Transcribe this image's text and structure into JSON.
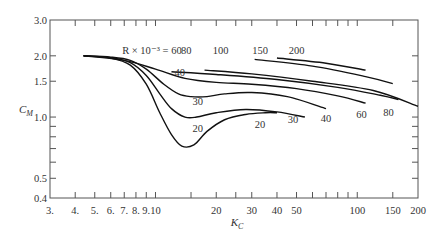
{
  "chart_data": {
    "type": "line",
    "title": "",
    "xlabel": "K_C",
    "ylabel": "C_M",
    "xscale": "log",
    "yscale": "log",
    "xlim": [
      3,
      200
    ],
    "ylim": [
      0.4,
      3.0
    ],
    "grid": false,
    "legend": "none (curves labeled inline with arrows)",
    "x_ticks": [
      3,
      4,
      5,
      6,
      7,
      8,
      9,
      10,
      20,
      30,
      40,
      50,
      100,
      150,
      200
    ],
    "x_tick_labels": [
      "3.",
      "4.",
      "5.",
      "6.",
      "7.",
      "8.",
      "9.",
      "10",
      "20",
      "30",
      "40",
      "50",
      "100",
      "150",
      "200"
    ],
    "x_minor_ticks": [
      15,
      25,
      60,
      70,
      80,
      90
    ],
    "y_ticks": [
      0.4,
      0.5,
      1.0,
      1.5,
      2.0,
      3.0
    ],
    "y_tick_labels": [
      "0.4",
      "0.5",
      "1.0",
      "1.5",
      "2.0",
      "3.0"
    ],
    "y_minor_ticks": [
      0.6,
      0.7,
      0.8,
      0.9
    ],
    "annotation_prefix": "R × 10⁻³ =",
    "series": [
      {
        "name": "R×10⁻³ = 20",
        "x": [
          4.4,
          6,
          7.5,
          9,
          10.5,
          12,
          13.5,
          15.5,
          18,
          22,
          28,
          35,
          40
        ],
        "y": [
          2.0,
          1.95,
          1.8,
          1.45,
          1.05,
          0.82,
          0.72,
          0.73,
          0.85,
          0.97,
          1.03,
          1.05,
          1.05
        ]
      },
      {
        "name": "R×10⁻³ = 30",
        "x": [
          4.4,
          6,
          7.5,
          9,
          10.5,
          12,
          14,
          16,
          20,
          28,
          40,
          55
        ],
        "y": [
          2.0,
          1.96,
          1.85,
          1.6,
          1.3,
          1.1,
          1.0,
          1.0,
          1.05,
          1.09,
          1.06,
          1.0
        ]
      },
      {
        "name": "R×10⁻³ = 40",
        "x": [
          4.4,
          6,
          7.5,
          9,
          11,
          13,
          15,
          18,
          22,
          30,
          45,
          70
        ],
        "y": [
          2.0,
          1.97,
          1.9,
          1.72,
          1.45,
          1.3,
          1.26,
          1.26,
          1.3,
          1.32,
          1.26,
          1.1
        ]
      },
      {
        "name": "R×10⁻³ = 60",
        "x": [
          4.4,
          7,
          10,
          14,
          20,
          30,
          50,
          80,
          110
        ],
        "y": [
          2.0,
          1.9,
          1.72,
          1.55,
          1.48,
          1.45,
          1.38,
          1.27,
          1.17
        ]
      },
      {
        "name": "R×10⁻³ = 80",
        "x": [
          12,
          20,
          40,
          80,
          130,
          160
        ],
        "y": [
          1.67,
          1.62,
          1.53,
          1.4,
          1.28,
          1.22
        ]
      },
      {
        "name": "R×10⁻³ = 100",
        "x": [
          17.5,
          30,
          60,
          120,
          200
        ],
        "y": [
          1.7,
          1.63,
          1.5,
          1.35,
          1.13
        ]
      },
      {
        "name": "R×10⁻³ = 150",
        "x": [
          31,
          60,
          110,
          150
        ],
        "y": [
          1.92,
          1.78,
          1.58,
          1.46
        ]
      },
      {
        "name": "R×10⁻³ = 200",
        "x": [
          40,
          70,
          110
        ],
        "y": [
          1.95,
          1.84,
          1.7
        ]
      }
    ],
    "annotations": [
      {
        "text": "R × 10⁻³ = 60",
        "x": 9.6,
        "y": 2.05
      },
      {
        "text": "80",
        "x": 14.2,
        "y": 2.05
      },
      {
        "text": "100",
        "x": 21,
        "y": 2.05
      },
      {
        "text": "150",
        "x": 33,
        "y": 2.05
      },
      {
        "text": "200",
        "x": 50,
        "y": 2.05
      },
      {
        "text": "40",
        "x": 13.2,
        "y": 1.6
      },
      {
        "text": "30",
        "x": 16.2,
        "y": 1.15
      },
      {
        "text": "20",
        "x": 16.2,
        "y": 0.84
      },
      {
        "text": "20",
        "x": 33,
        "y": 0.88
      },
      {
        "text": "30",
        "x": 48,
        "y": 0.93
      },
      {
        "text": "40",
        "x": 70,
        "y": 0.95
      },
      {
        "text": "60",
        "x": 105,
        "y": 0.99
      },
      {
        "text": "80",
        "x": 143,
        "y": 1.01
      }
    ]
  },
  "labels": {
    "xlabel_main": "K",
    "xlabel_sub": "C",
    "ylabel_main": "C",
    "ylabel_sub": "M"
  }
}
